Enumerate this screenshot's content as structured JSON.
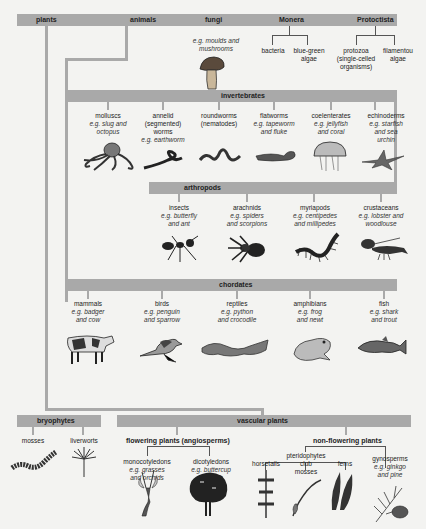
{
  "kingdoms": {
    "plants": "plants",
    "animals": "animals",
    "fungi": "fungi",
    "monera": "Monera",
    "protoctista": "Protoctista"
  },
  "fungi": {
    "example1": "e.g. moulds and",
    "example2": "mushrooms",
    "icon": "mushroom-icon"
  },
  "monera": {
    "items": [
      {
        "name": "bacteria",
        "line2": ""
      },
      {
        "name": "blue-green",
        "line2": "algae"
      }
    ]
  },
  "protoctista": {
    "items": [
      {
        "name": "protozoa",
        "line2": "(single-celled",
        "line3": "organisms)"
      },
      {
        "name": "filamentou",
        "line2": "algae"
      }
    ]
  },
  "invertebrates": {
    "title": "invertebrates",
    "items": [
      {
        "name": "molluscs",
        "l2": "",
        "ex1": "e.g. slug and",
        "ex2": "octopus",
        "icon": "octopus-icon"
      },
      {
        "name": "annelid",
        "l2": "(segmented)",
        "l3": "worms",
        "ex1": "e.g. earthworm",
        "icon": "earthworm-icon"
      },
      {
        "name": "roundworms",
        "l2": "(nematodes)",
        "icon": "roundworm-icon"
      },
      {
        "name": "flatworms",
        "ex1": "e.g. tapeworm",
        "ex2": "and fluke",
        "icon": "flatworm-icon"
      },
      {
        "name": "coelenterates",
        "ex1": "e.g. jellyfish",
        "ex2": "and coral",
        "icon": "jellyfish-icon"
      },
      {
        "name": "echinoderms",
        "ex1": "e.g. starfish",
        "ex2": "and sea",
        "ex3": "urchin",
        "icon": "starfish-icon"
      }
    ]
  },
  "arthropods": {
    "title": "arthropods",
    "items": [
      {
        "name": "insects",
        "ex1": "e.g. butterfly",
        "ex2": "and ant",
        "icon": "ant-icon"
      },
      {
        "name": "arachnids",
        "ex1": "e.g. spiders",
        "ex2": "and scorpions",
        "icon": "spider-icon"
      },
      {
        "name": "myriapods",
        "ex1": "e.g. centipedes",
        "ex2": "and millipedes",
        "icon": "centipede-icon"
      },
      {
        "name": "crustaceans",
        "ex1": "e.g. lobster and",
        "ex2": "woodlouse",
        "icon": "lobster-icon"
      }
    ]
  },
  "chordates": {
    "title": "chordates",
    "items": [
      {
        "name": "mammals",
        "ex1": "e.g. badger",
        "ex2": "and cow",
        "icon": "cow-icon"
      },
      {
        "name": "birds",
        "ex1": "e.g. penguin",
        "ex2": "and sparrow",
        "icon": "sparrow-icon"
      },
      {
        "name": "reptiles",
        "ex1": "e.g. python",
        "ex2": "and crocodile",
        "icon": "python-icon"
      },
      {
        "name": "amphibians",
        "ex1": "e.g. frog",
        "ex2": "and newt",
        "icon": "frog-icon"
      },
      {
        "name": "fish",
        "ex1": "e.g. shark",
        "ex2": "and trout",
        "icon": "trout-icon"
      }
    ]
  },
  "bryophytes": {
    "title": "bryophytes",
    "items": [
      {
        "name": "mosses",
        "icon": "moss-icon"
      },
      {
        "name": "liverworts",
        "icon": "liverwort-icon"
      }
    ]
  },
  "vascular": {
    "title": "vascular plants",
    "flowering": {
      "title": "flowering plants (angiosperms)",
      "items": [
        {
          "name": "monocotyledons",
          "ex1": "e.g. grasses",
          "ex2": "and orchids",
          "icon": "orchid-icon"
        },
        {
          "name": "dicotyledons",
          "ex1": "e.g. buttercup",
          "ex2": "and oak",
          "icon": "oak-tree-icon"
        }
      ]
    },
    "nonflowering": {
      "title": "non-flowering plants",
      "pteridophytes": {
        "title": "pteridophytes",
        "items": [
          {
            "name": "horsetails",
            "icon": "horsetail-icon"
          },
          {
            "name": "club",
            "l2": "mosses",
            "icon": "club-moss-icon"
          },
          {
            "name": "ferns",
            "icon": "fern-icon"
          }
        ]
      },
      "gymnosperms": {
        "name": "gynosperms",
        "ex1": "e.g. ginkgo",
        "ex2": "and pine",
        "icon": "pine-icon"
      }
    }
  }
}
